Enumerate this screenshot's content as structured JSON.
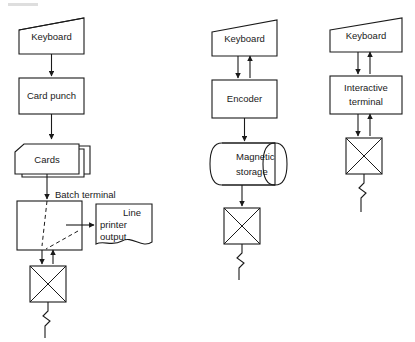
{
  "diagram": {
    "colors": {
      "stroke": "#1a1a1a",
      "fill": "#ffffff",
      "background": "#ffffff"
    },
    "columns": [
      {
        "id": "batch-card-punch",
        "name": "Batch card punch data entry",
        "nodes": [
          {
            "id": "c1-keyboard",
            "label": "Keyboard",
            "shape": "keyboard-trapezoid"
          },
          {
            "id": "c1-card-punch",
            "label": "Card  punch",
            "shape": "process-rectangle"
          },
          {
            "id": "c1-cards",
            "label": "Cards",
            "shape": "stacked-cards"
          },
          {
            "id": "c1-batch-terminal",
            "label": "",
            "shape": "process-rectangle"
          },
          {
            "id": "c1-line-printer",
            "label": "Line\nprinter\noutput",
            "shape": "document"
          },
          {
            "id": "c1-comm-link",
            "label": "",
            "shape": "crossed-box"
          }
        ],
        "edge_labels": [
          {
            "id": "c1-batch-terminal-label",
            "text": "Batch terminal"
          }
        ]
      },
      {
        "id": "key-to-storage",
        "name": "Key to magnetic storage data entry",
        "nodes": [
          {
            "id": "c2-keyboard",
            "label": "Keyboard",
            "shape": "keyboard-trapezoid"
          },
          {
            "id": "c2-encoder",
            "label": "Encoder",
            "shape": "process-rectangle"
          },
          {
            "id": "c2-magnetic",
            "label": "Magnetic\nstorage",
            "shape": "cylinder"
          },
          {
            "id": "c2-comm-link",
            "label": "",
            "shape": "crossed-box"
          }
        ],
        "edge_labels": []
      },
      {
        "id": "interactive-terminal",
        "name": "Interactive terminal data entry",
        "nodes": [
          {
            "id": "c3-keyboard",
            "label": "Keyboard",
            "shape": "keyboard-trapezoid"
          },
          {
            "id": "c3-interactive",
            "label": "Interactive\nterminal",
            "shape": "process-rectangle"
          },
          {
            "id": "c3-comm-link",
            "label": "",
            "shape": "crossed-box"
          }
        ],
        "edge_labels": []
      }
    ],
    "text": {
      "keyboard": "Keyboard",
      "card_punch": "Card  punch",
      "cards": "Cards",
      "batch_terminal": "Batch terminal",
      "line_printer_1": "Line",
      "line_printer_2": "printer",
      "line_printer_3": "output",
      "encoder": "Encoder",
      "magnetic_1": "Magnetic",
      "magnetic_2": "storage",
      "interactive_1": "Interactive",
      "interactive_2": "terminal"
    }
  }
}
